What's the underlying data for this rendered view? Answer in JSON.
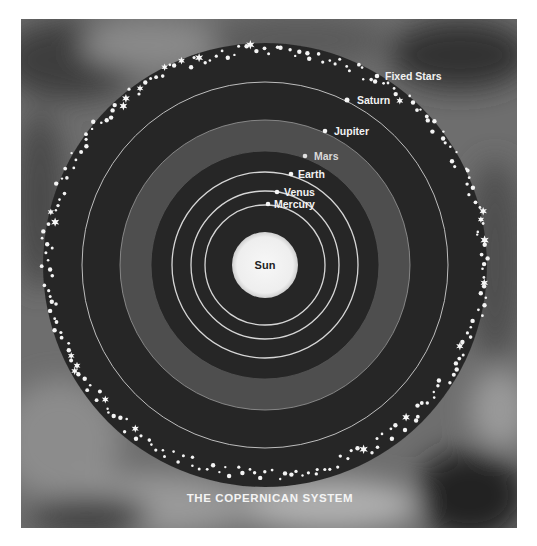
{
  "diagram": {
    "title": "THE COPERNICAN SYSTEM",
    "center": {
      "label": "Sun"
    },
    "bodies": [
      {
        "name": "Mercury",
        "orbit_radius": 60,
        "dot": [
          268,
          204
        ],
        "label_pos": [
          274,
          208
        ]
      },
      {
        "name": "Venus",
        "orbit_radius": 74,
        "dot": [
          277,
          192
        ],
        "label_pos": [
          284,
          196
        ]
      },
      {
        "name": "Earth",
        "orbit_radius": 93,
        "dot": [
          291,
          174
        ],
        "label_pos": [
          298,
          178
        ]
      },
      {
        "name": "Mars",
        "orbit_radius": 114,
        "dot": [
          305,
          156
        ],
        "label_pos": [
          314,
          160
        ]
      },
      {
        "name": "Jupiter",
        "orbit_radius": 145,
        "dot": [
          325,
          131
        ],
        "label_pos": [
          334,
          135
        ]
      },
      {
        "name": "Saturn",
        "orbit_radius": 183,
        "dot": [
          347,
          100
        ],
        "label_pos": [
          357,
          104
        ]
      },
      {
        "name": "Fixed Stars",
        "orbit_radius": 216,
        "dot": [
          377,
          76
        ],
        "label_pos": [
          385,
          80
        ]
      }
    ],
    "colors": {
      "space": "#262626",
      "band": "#4d4d4d",
      "orbit_line": "#cfcfcf",
      "sun": "#f3f3f3",
      "background": "#6b6b6b",
      "stars": "#f5f5f5"
    }
  }
}
